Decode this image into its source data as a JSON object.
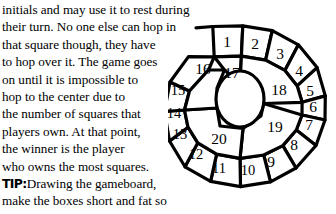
{
  "page": {
    "background_color": "#ffffff",
    "ink_color": "#000000",
    "width": 336,
    "height": 214
  },
  "body_copy": {
    "lines": [
      "initials and may use it to rest during",
      "their turn. No one else can hop in",
      "that square though, they have",
      "to hop over it. The game goes",
      "on until it is impossible to",
      "hop to the center due to",
      "the number of squares that",
      "players own. At that point,",
      "the winner is the player",
      "who owns the most squares."
    ]
  },
  "tip": {
    "label": "TIP:",
    "lines": [
      "Drawing the gameboard,",
      "make the boxes short and fat so",
      "that players can hop over them."
    ]
  },
  "gameboard": {
    "title": "spiral-hopscotch-board",
    "outer_ring_labels": [
      "1",
      "2",
      "3",
      "4",
      "5",
      "6",
      "7",
      "8",
      "9",
      "10",
      "11",
      "12",
      "13",
      "14",
      "15",
      "16"
    ],
    "inner_ring_labels": [
      "17",
      "18",
      "19",
      "20"
    ],
    "center_label": "",
    "total_squares": 20,
    "stroke_color": "#000000",
    "fill_color": "#ffffff"
  }
}
